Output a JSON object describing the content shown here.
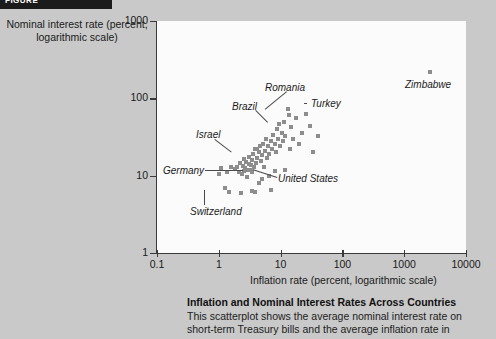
{
  "banner": {
    "label": "FIGURE"
  },
  "axes": {
    "y_title": "Nominal interest rate (percent, logarithmic scale)",
    "x_title": "Inflation rate (percent, logarithmic scale)",
    "y_ticks": [
      "1000",
      "100",
      "10",
      "1"
    ],
    "x_ticks": [
      "0.1",
      "1",
      "10",
      "100",
      "1000",
      "10000"
    ]
  },
  "caption": {
    "title": "Inflation and Nominal Interest Rates Across Countries",
    "body": "This scatterplot shows the average nominal interest rate on short-term Treasury bills and the average inflation rate in"
  },
  "annotations": [
    {
      "label": "Romania"
    },
    {
      "label": "Turkey"
    },
    {
      "label": "Zimbabwe"
    },
    {
      "label": "Brazil"
    },
    {
      "label": "Israel"
    },
    {
      "label": "Germany"
    },
    {
      "label": "United States"
    },
    {
      "label": "Switzerland"
    }
  ],
  "chart_data": {
    "type": "scatter",
    "title": "Inflation and Nominal Interest Rates Across Countries",
    "xlabel": "Inflation rate (percent, logarithmic scale)",
    "ylabel": "Nominal interest rate (percent, logarithmic scale)",
    "xscale": "log",
    "yscale": "log",
    "xlim": [
      0.1,
      10000
    ],
    "ylim": [
      1,
      1000
    ],
    "xticks": [
      0.1,
      1,
      10,
      100,
      1000,
      10000
    ],
    "yticks": [
      1,
      10,
      100,
      1000
    ],
    "grid": false,
    "legend": "none",
    "marker": "square",
    "marker_color": "#8d8d8d",
    "labeled_points": [
      {
        "name": "Zimbabwe",
        "x": 2600,
        "y": 220
      },
      {
        "name": "Romania",
        "x": 13,
        "y": 72
      },
      {
        "name": "Turkey",
        "x": 26,
        "y": 63
      },
      {
        "name": "Brazil",
        "x": 9.5,
        "y": 46
      },
      {
        "name": "Israel",
        "x": 4.2,
        "y": 22
      },
      {
        "name": "Germany",
        "x": 2.0,
        "y": 13
      },
      {
        "name": "United States",
        "x": 3.2,
        "y": 12
      },
      {
        "name": "Switzerland",
        "x": 2.3,
        "y": 6.0
      }
    ],
    "points": [
      {
        "x": 1.1,
        "y": 12.5
      },
      {
        "x": 1.25,
        "y": 7.0
      },
      {
        "x": 1.45,
        "y": 6.1
      },
      {
        "x": 1.6,
        "y": 13.0
      },
      {
        "x": 1.8,
        "y": 12.2
      },
      {
        "x": 2.0,
        "y": 13.0
      },
      {
        "x": 2.1,
        "y": 11.0
      },
      {
        "x": 2.2,
        "y": 14.5
      },
      {
        "x": 2.3,
        "y": 6.0
      },
      {
        "x": 2.35,
        "y": 10.4
      },
      {
        "x": 2.5,
        "y": 13.5
      },
      {
        "x": 2.55,
        "y": 16.5
      },
      {
        "x": 2.6,
        "y": 11.5
      },
      {
        "x": 2.7,
        "y": 12.6
      },
      {
        "x": 2.8,
        "y": 15.0
      },
      {
        "x": 2.9,
        "y": 9.6
      },
      {
        "x": 3.0,
        "y": 12.0
      },
      {
        "x": 3.05,
        "y": 14.0
      },
      {
        "x": 3.1,
        "y": 17.5
      },
      {
        "x": 3.2,
        "y": 12.0
      },
      {
        "x": 3.3,
        "y": 13.8
      },
      {
        "x": 3.4,
        "y": 11.0
      },
      {
        "x": 3.5,
        "y": 16.0
      },
      {
        "x": 3.6,
        "y": 19.0
      },
      {
        "x": 3.7,
        "y": 12.8
      },
      {
        "x": 3.8,
        "y": 6.2
      },
      {
        "x": 3.9,
        "y": 22.0
      },
      {
        "x": 4.0,
        "y": 14.5
      },
      {
        "x": 4.1,
        "y": 17.0
      },
      {
        "x": 4.2,
        "y": 22.0
      },
      {
        "x": 4.4,
        "y": 20.0
      },
      {
        "x": 4.6,
        "y": 24.0
      },
      {
        "x": 4.8,
        "y": 15.5
      },
      {
        "x": 5.0,
        "y": 18.5
      },
      {
        "x": 5.2,
        "y": 26.0
      },
      {
        "x": 5.4,
        "y": 13.0
      },
      {
        "x": 5.6,
        "y": 21.0
      },
      {
        "x": 5.8,
        "y": 30.0
      },
      {
        "x": 6.0,
        "y": 17.0
      },
      {
        "x": 6.3,
        "y": 24.0
      },
      {
        "x": 6.6,
        "y": 19.0
      },
      {
        "x": 7.0,
        "y": 28.0
      },
      {
        "x": 7.3,
        "y": 22.0
      },
      {
        "x": 7.6,
        "y": 34.0
      },
      {
        "x": 8.0,
        "y": 26.0
      },
      {
        "x": 8.3,
        "y": 20.0
      },
      {
        "x": 8.6,
        "y": 40.0
      },
      {
        "x": 9.0,
        "y": 30.0
      },
      {
        "x": 9.5,
        "y": 46.0
      },
      {
        "x": 9.8,
        "y": 24.0
      },
      {
        "x": 10.5,
        "y": 36.0
      },
      {
        "x": 11.0,
        "y": 28.0
      },
      {
        "x": 11.5,
        "y": 50.0
      },
      {
        "x": 12.0,
        "y": 33.0
      },
      {
        "x": 13.0,
        "y": 72.0
      },
      {
        "x": 13.5,
        "y": 60.0
      },
      {
        "x": 14.0,
        "y": 22.0
      },
      {
        "x": 15.0,
        "y": 42.0
      },
      {
        "x": 16.0,
        "y": 30.0
      },
      {
        "x": 18.0,
        "y": 55.0
      },
      {
        "x": 20.0,
        "y": 26.0
      },
      {
        "x": 22.0,
        "y": 36.0
      },
      {
        "x": 26.0,
        "y": 63.0
      },
      {
        "x": 30.0,
        "y": 44.0
      },
      {
        "x": 34.0,
        "y": 20.0
      },
      {
        "x": 40.0,
        "y": 33.0
      },
      {
        "x": 5.0,
        "y": 9.0
      },
      {
        "x": 6.5,
        "y": 10.0
      },
      {
        "x": 8.0,
        "y": 11.5
      },
      {
        "x": 4.5,
        "y": 8.0
      },
      {
        "x": 3.5,
        "y": 6.4
      },
      {
        "x": 7.0,
        "y": 6.6
      },
      {
        "x": 12.0,
        "y": 12.0
      },
      {
        "x": 1.0,
        "y": 10.5
      },
      {
        "x": 1.35,
        "y": 11.0
      },
      {
        "x": 2600,
        "y": 220
      }
    ]
  }
}
